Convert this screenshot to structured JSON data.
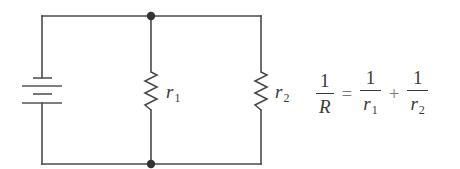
{
  "diagram": {
    "type": "circuit",
    "components": [
      {
        "id": "battery",
        "kind": "battery",
        "label": ""
      },
      {
        "id": "r1",
        "kind": "resistor",
        "label": "r",
        "subscript": "1"
      },
      {
        "id": "r2",
        "kind": "resistor",
        "label": "r",
        "subscript": "2"
      }
    ],
    "nodes": [
      "top-junction",
      "bottom-junction"
    ],
    "colors": {
      "wire": "#4a4a4a",
      "node": "#333333",
      "text": "#3a3a3a"
    }
  },
  "labels": {
    "r1": {
      "base": "r",
      "sub": "1"
    },
    "r2": {
      "base": "r",
      "sub": "2"
    }
  },
  "formula": {
    "lhs": {
      "num": "1",
      "den": "R"
    },
    "equals": "=",
    "term1": {
      "num": "1",
      "den_base": "r",
      "den_sub": "1"
    },
    "plus": "+",
    "term2": {
      "num": "1",
      "den_base": "r",
      "den_sub": "2"
    }
  }
}
